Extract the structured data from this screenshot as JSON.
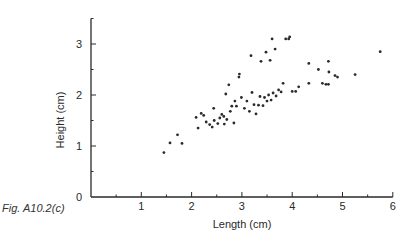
{
  "caption": "Fig. A10.2(c)",
  "chart_data": {
    "type": "scatter",
    "title": "",
    "xlabel": "Length (cm)",
    "ylabel": "Height (cm)",
    "xlim": [
      0,
      6
    ],
    "ylim": [
      0,
      3.5
    ],
    "x_ticks": [
      1,
      2,
      3,
      4,
      5,
      6
    ],
    "x_minor_ticks": [
      0.5,
      1.5,
      2.5,
      3.5,
      4.5,
      5.5
    ],
    "y_ticks": [
      0,
      1,
      2,
      3
    ],
    "y_minor_ticks": [
      0.5,
      1.5,
      2.5,
      3.5
    ],
    "grid": false,
    "legend": null,
    "marker_color": "#2a2a2a",
    "points": [
      {
        "x": 1.45,
        "y": 0.87
      },
      {
        "x": 1.57,
        "y": 1.06
      },
      {
        "x": 1.72,
        "y": 1.22
      },
      {
        "x": 1.81,
        "y": 1.05
      },
      {
        "x": 2.09,
        "y": 1.56
      },
      {
        "x": 2.13,
        "y": 1.35
      },
      {
        "x": 2.19,
        "y": 1.64
      },
      {
        "x": 2.24,
        "y": 1.6
      },
      {
        "x": 2.29,
        "y": 1.47
      },
      {
        "x": 2.36,
        "y": 1.42
      },
      {
        "x": 2.41,
        "y": 1.37
      },
      {
        "x": 2.44,
        "y": 1.74
      },
      {
        "x": 2.45,
        "y": 1.5
      },
      {
        "x": 2.52,
        "y": 1.44
      },
      {
        "x": 2.56,
        "y": 1.55
      },
      {
        "x": 2.6,
        "y": 1.62
      },
      {
        "x": 2.64,
        "y": 1.58
      },
      {
        "x": 2.65,
        "y": 1.43
      },
      {
        "x": 2.68,
        "y": 2.02
      },
      {
        "x": 2.7,
        "y": 1.52
      },
      {
        "x": 2.74,
        "y": 2.2
      },
      {
        "x": 2.77,
        "y": 1.68
      },
      {
        "x": 2.8,
        "y": 1.78
      },
      {
        "x": 2.84,
        "y": 1.45
      },
      {
        "x": 2.86,
        "y": 1.88
      },
      {
        "x": 2.89,
        "y": 1.78
      },
      {
        "x": 2.94,
        "y": 2.35
      },
      {
        "x": 2.95,
        "y": 2.41
      },
      {
        "x": 2.99,
        "y": 1.95
      },
      {
        "x": 3.05,
        "y": 1.74
      },
      {
        "x": 3.1,
        "y": 1.88
      },
      {
        "x": 3.15,
        "y": 1.68
      },
      {
        "x": 3.18,
        "y": 2.77
      },
      {
        "x": 3.2,
        "y": 2.05
      },
      {
        "x": 3.24,
        "y": 1.81
      },
      {
        "x": 3.28,
        "y": 1.63
      },
      {
        "x": 3.33,
        "y": 1.8
      },
      {
        "x": 3.36,
        "y": 1.97
      },
      {
        "x": 3.38,
        "y": 2.66
      },
      {
        "x": 3.42,
        "y": 1.79
      },
      {
        "x": 3.45,
        "y": 1.95
      },
      {
        "x": 3.48,
        "y": 2.84
      },
      {
        "x": 3.5,
        "y": 1.88
      },
      {
        "x": 3.53,
        "y": 2.0
      },
      {
        "x": 3.56,
        "y": 2.68
      },
      {
        "x": 3.58,
        "y": 1.9
      },
      {
        "x": 3.6,
        "y": 3.1
      },
      {
        "x": 3.62,
        "y": 2.04
      },
      {
        "x": 3.66,
        "y": 2.9
      },
      {
        "x": 3.68,
        "y": 1.98
      },
      {
        "x": 3.73,
        "y": 2.1
      },
      {
        "x": 3.78,
        "y": 2.06
      },
      {
        "x": 3.82,
        "y": 2.23
      },
      {
        "x": 3.87,
        "y": 3.1
      },
      {
        "x": 3.93,
        "y": 3.1
      },
      {
        "x": 3.95,
        "y": 3.14
      },
      {
        "x": 4.0,
        "y": 2.07
      },
      {
        "x": 4.07,
        "y": 2.07
      },
      {
        "x": 4.13,
        "y": 2.16
      },
      {
        "x": 4.33,
        "y": 2.23
      },
      {
        "x": 4.33,
        "y": 2.62
      },
      {
        "x": 4.52,
        "y": 2.5
      },
      {
        "x": 4.6,
        "y": 2.23
      },
      {
        "x": 4.67,
        "y": 2.21
      },
      {
        "x": 4.72,
        "y": 2.21
      },
      {
        "x": 4.72,
        "y": 2.66
      },
      {
        "x": 4.73,
        "y": 2.45
      },
      {
        "x": 4.85,
        "y": 2.38
      },
      {
        "x": 4.9,
        "y": 2.35
      },
      {
        "x": 5.25,
        "y": 2.4
      },
      {
        "x": 5.75,
        "y": 2.85
      }
    ]
  }
}
